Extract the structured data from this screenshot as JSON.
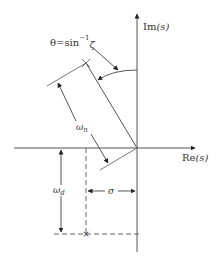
{
  "diagram": {
    "type": "s-plane pole location",
    "colors": {
      "line": "#555555",
      "text": "#333333",
      "background": "#ffffff"
    },
    "axes": {
      "imaginary": {
        "label_main": "Im",
        "label_arg": "(s)"
      },
      "real": {
        "label_main": "Re",
        "label_arg": "(s)"
      }
    },
    "labels": {
      "theta": {
        "lhs": "θ",
        "eq": "=",
        "fn": "sin",
        "sup": "−1",
        "arg": "ζ"
      },
      "omega_n": {
        "base": "ω",
        "sub": "n"
      },
      "omega_d": {
        "base": "ω",
        "sub": "d"
      },
      "sigma": {
        "text": "σ"
      }
    },
    "pole": {
      "symbol": "×"
    }
  }
}
